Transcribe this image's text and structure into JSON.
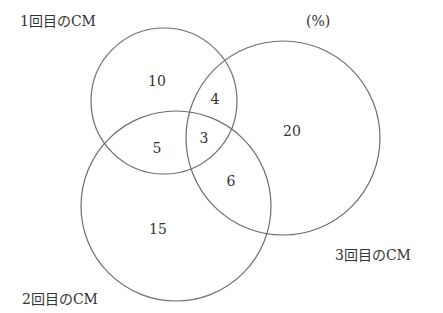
{
  "diagram": {
    "type": "venn",
    "unit_label": "(%)",
    "sets": [
      {
        "id": "A",
        "label": "1回目のCM",
        "circle": {
          "cx": 164,
          "cy": 101,
          "r": 73
        }
      },
      {
        "id": "B",
        "label": "2回目のCM",
        "circle": {
          "cx": 176,
          "cy": 206,
          "r": 95
        }
      },
      {
        "id": "C",
        "label": "3回目のCM",
        "circle": {
          "cx": 283,
          "cy": 138,
          "r": 97
        }
      }
    ],
    "regions": [
      {
        "sets": [
          "A"
        ],
        "value": "10",
        "x": 157,
        "y": 81
      },
      {
        "sets": [
          "A",
          "C"
        ],
        "value": "4",
        "x": 215,
        "y": 99
      },
      {
        "sets": [
          "A",
          "B"
        ],
        "value": "5",
        "x": 157,
        "y": 148
      },
      {
        "sets": [
          "A",
          "B",
          "C"
        ],
        "value": "3",
        "x": 204,
        "y": 138
      },
      {
        "sets": [
          "C"
        ],
        "value": "20",
        "x": 292,
        "y": 131
      },
      {
        "sets": [
          "B",
          "C"
        ],
        "value": "6",
        "x": 231,
        "y": 181
      },
      {
        "sets": [
          "B"
        ],
        "value": "15",
        "x": 158,
        "y": 229
      }
    ],
    "stroke_color": "#6e6e6e",
    "text_color": "#333333"
  }
}
